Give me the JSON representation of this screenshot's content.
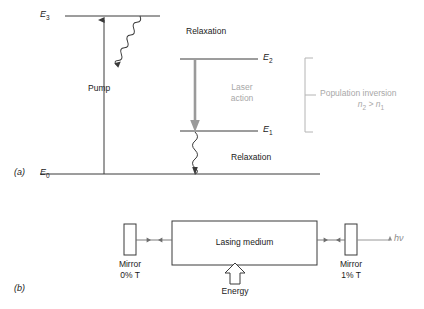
{
  "figure": {
    "panel_a": {
      "tag": "(a)",
      "levels": [
        {
          "name": "E",
          "sub": "3"
        },
        {
          "name": "E",
          "sub": "2"
        },
        {
          "name": "E",
          "sub": "1"
        },
        {
          "name": "E",
          "sub": "0"
        }
      ],
      "pump_label": "Pump",
      "relaxation_top_label": "Relaxation",
      "relaxation_bottom_label": "Relaxation",
      "laser_action_line1": "Laser",
      "laser_action_line2": "action",
      "inversion_label": "Population inversion",
      "inversion_condition_n": "n",
      "inversion_condition_sub2": "2",
      "inversion_condition_gt": " > ",
      "inversion_condition_n1": "n",
      "inversion_condition_sub1": "1"
    },
    "panel_b": {
      "tag": "(b)",
      "medium_label": "Lasing medium",
      "left_mirror_line1": "Mirror",
      "left_mirror_line2": "0% T",
      "right_mirror_line1": "Mirror",
      "right_mirror_line2": "1% T",
      "energy_label": "Energy",
      "output_label": "hν"
    },
    "colors": {
      "line": "#3a3a3a",
      "gray_text": "#a8a8a8",
      "laser_arrow": "#9a9a9a",
      "background": "#ffffff"
    }
  }
}
